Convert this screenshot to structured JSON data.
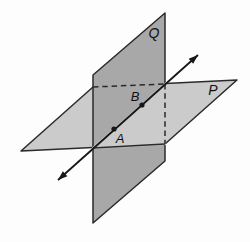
{
  "figure_title": "Two intersecting planes P and Q with line through points A and B",
  "canvas": {
    "width": 250,
    "height": 242,
    "background": "#fdfdfd"
  },
  "colors": {
    "plane_q_fill": "#a8a8a8",
    "plane_p_fill": "#cbcbcb",
    "outline": "#2a2a2a",
    "line": "#171717",
    "label": "#111111"
  },
  "planes": [
    {
      "id": "plane-q-face",
      "label_id": "plane-q-label",
      "label": "Q",
      "fill_key": "plane_q_fill",
      "points": [
        [
          93,
          75
        ],
        [
          165,
          13
        ],
        [
          165,
          161
        ],
        [
          93,
          223
        ]
      ],
      "label_pos": [
        154,
        38
      ],
      "label_size": 14
    },
    {
      "id": "plane-p-face",
      "label_id": "plane-p-label",
      "label": "P",
      "fill_key": "plane_p_fill",
      "points": [
        [
          21,
          151
        ],
        [
          93,
          87
        ],
        [
          237,
          80
        ],
        [
          165,
          144
        ]
      ],
      "label_pos": [
        213,
        95
      ],
      "label_size": 14
    }
  ],
  "front_overlay": {
    "id": "plane-p-front-region",
    "fill_key": "plane_p_fill",
    "points": [
      [
        93,
        148
      ],
      [
        165,
        84
      ],
      [
        165,
        144
      ]
    ]
  },
  "front_edge": {
    "id": "plane-p-bottom-edge-front",
    "from": [
      93,
      148
    ],
    "to": [
      165,
      144
    ]
  },
  "hidden_edges": [
    {
      "id": "hidden-edge-plane-p-top",
      "from": [
        93,
        87
      ],
      "to": [
        165,
        84
      ]
    },
    {
      "id": "hidden-edge-plane-q-right",
      "from": [
        165,
        84
      ],
      "to": [
        165,
        144
      ]
    }
  ],
  "intersection_line": {
    "id": "intersection-line",
    "from": [
      58,
      180
    ],
    "to": [
      198,
      55
    ],
    "arrow_start": true,
    "arrow_end": true,
    "width": 1.8
  },
  "points": [
    {
      "id": "point-a-dot",
      "label_id": "point-a-label",
      "label": "A",
      "at": [
        114,
        129
      ],
      "label_pos": [
        120,
        143
      ],
      "label_size": 13,
      "radius": 2.6
    },
    {
      "id": "point-b-dot",
      "label_id": "point-b-label",
      "label": "B",
      "at": [
        142,
        105
      ],
      "label_pos": [
        135,
        101
      ],
      "label_size": 13,
      "radius": 2.6
    }
  ],
  "style": {
    "outline_width": 1.5,
    "dash_pattern": "5.5,3.8",
    "arrow_length": 9.5,
    "arrow_half_width": 3.4
  }
}
